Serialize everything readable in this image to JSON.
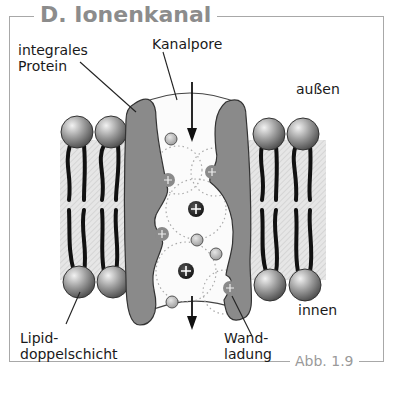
{
  "figure": {
    "title": "D. Ionenkanal",
    "figure_number": "Abb. 1.9"
  },
  "labels": {
    "integral_protein": "integrales\nProtein",
    "channel_pore": "Kanalpore",
    "outside": "außen",
    "inside": "innen",
    "lipid_bilayer": "Lipid-\ndoppelschicht",
    "wall_charge": "Wand-\nladung"
  },
  "colors": {
    "protein": "#8a8a8a",
    "lipid_head": "#9a9a9a",
    "cation": "#2a2a2a",
    "anion_small": "#b8b8b8",
    "frame": "#a8a8a8",
    "title": "#8c8c8c"
  },
  "ions": {
    "cation_symbol": "+",
    "wall_charge_symbol": "+"
  }
}
